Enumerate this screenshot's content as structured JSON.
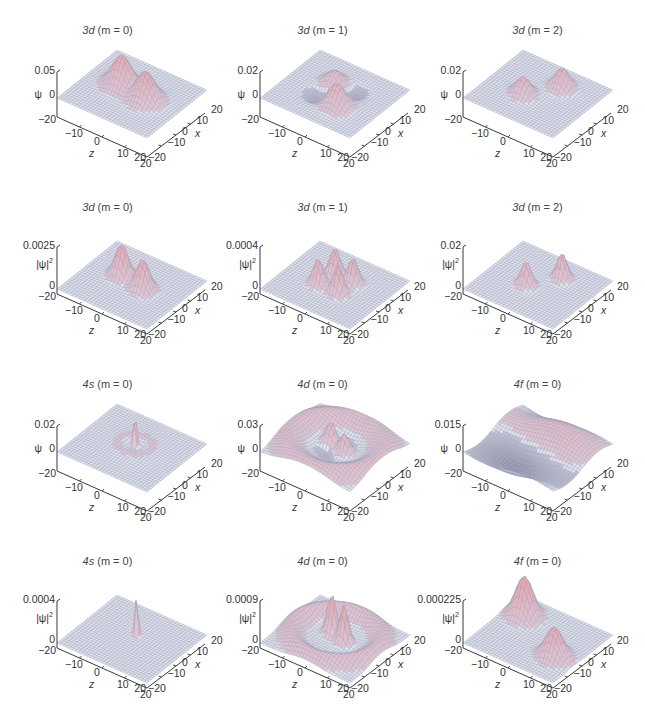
{
  "figure": {
    "rows": 4,
    "cols": 3
  },
  "chart_data": [
    {
      "type": "surface",
      "title": "3d (m = 0)",
      "orbital": "3d",
      "m": 0,
      "quantity": "psi",
      "zlabel": "ψ",
      "zticks": [
        "0.05",
        "0"
      ],
      "zmin_tick": "-20",
      "xlabel": "z",
      "ylabel": "x",
      "xticks": [
        "-10",
        "0",
        "10",
        "20"
      ],
      "yticks": [
        "-20",
        "-10",
        "0",
        "10",
        "20"
      ],
      "xlim": [
        -20,
        20
      ],
      "ylim": [
        -20,
        20
      ],
      "zmax": 0.05,
      "shape": "two lobes along z with opposite-sign ring"
    },
    {
      "type": "surface",
      "title": "3d (m = 1)",
      "orbital": "3d",
      "m": 1,
      "quantity": "psi",
      "zlabel": "ψ",
      "zticks": [
        "0.02",
        "0"
      ],
      "zmin_tick": "-20",
      "xlabel": "z",
      "ylabel": "x",
      "xticks": [
        "-10",
        "0",
        "10",
        "20"
      ],
      "yticks": [
        "-20",
        "-10",
        "0",
        "10",
        "20"
      ],
      "xlim": [
        -20,
        20
      ],
      "ylim": [
        -20,
        20
      ],
      "zmax": 0.02,
      "shape": "four-lobe saddle (positive/negative diagonals)"
    },
    {
      "type": "surface",
      "title": "3d (m = 2)",
      "orbital": "3d",
      "m": 2,
      "quantity": "psi",
      "zlabel": "ψ",
      "zticks": [
        "0.02",
        "0"
      ],
      "zmin_tick": "-20",
      "xlabel": "z",
      "ylabel": "x",
      "xticks": [
        "-10",
        "0",
        "10",
        "20"
      ],
      "yticks": [
        "-20",
        "-10",
        "0",
        "10",
        "20"
      ],
      "xlim": [
        -20,
        20
      ],
      "ylim": [
        -20,
        20
      ],
      "zmax": 0.02,
      "shape": "two lobes along x"
    },
    {
      "type": "surface",
      "title": "3d (m = 0)",
      "orbital": "3d",
      "m": 0,
      "quantity": "|psi|^2",
      "zlabel": "|ψ|²",
      "zticks": [
        "0.0025",
        "0"
      ],
      "zmin_tick": "-20",
      "xlabel": "z",
      "ylabel": "x",
      "xticks": [
        "-10",
        "0",
        "10",
        "20"
      ],
      "yticks": [
        "-20",
        "-10",
        "0",
        "10",
        "20"
      ],
      "xlim": [
        -20,
        20
      ],
      "ylim": [
        -20,
        20
      ],
      "zmax": 0.0025,
      "shape": "two peaks along z"
    },
    {
      "type": "surface",
      "title": "3d (m = 1)",
      "orbital": "3d",
      "m": 1,
      "quantity": "|psi|^2",
      "zlabel": "|ψ|²",
      "zticks": [
        "0.0004",
        "0"
      ],
      "zmin_tick": "-20",
      "xlabel": "z",
      "ylabel": "x",
      "xticks": [
        "-10",
        "0",
        "10",
        "20"
      ],
      "yticks": [
        "-20",
        "-10",
        "0",
        "10",
        "20"
      ],
      "xlim": [
        -20,
        20
      ],
      "ylim": [
        -20,
        20
      ],
      "zmax": 0.0004,
      "shape": "four peaks"
    },
    {
      "type": "surface",
      "title": "3d (m = 2)",
      "orbital": "3d",
      "m": 2,
      "quantity": "|psi|^2",
      "zlabel": "|ψ|²",
      "zticks": [
        "0.02",
        "0"
      ],
      "zmin_tick": "-20",
      "xlabel": "z",
      "ylabel": "x",
      "xticks": [
        "-10",
        "0",
        "10",
        "20"
      ],
      "yticks": [
        "-20",
        "-10",
        "0",
        "10",
        "20"
      ],
      "xlim": [
        -20,
        20
      ],
      "ylim": [
        -20,
        20
      ],
      "zmax": 0.02,
      "shape": "two peaks along x"
    },
    {
      "type": "surface",
      "title": "4s (m = 0)",
      "orbital": "4s",
      "m": 0,
      "quantity": "psi",
      "zlabel": "ψ",
      "zticks": [
        "0.02",
        "0"
      ],
      "zmin_tick": "-20",
      "xlabel": "z",
      "ylabel": "x",
      "xticks": [
        "-10",
        "0",
        "10",
        "20"
      ],
      "yticks": [
        "-20",
        "-10",
        "0",
        "10",
        "20"
      ],
      "xlim": [
        -20,
        20
      ],
      "ylim": [
        -20,
        20
      ],
      "zmax": 0.02,
      "shape": "sharp central spike with radial nodes"
    },
    {
      "type": "surface",
      "title": "4d (m = 0)",
      "orbital": "4d",
      "m": 0,
      "quantity": "psi",
      "zlabel": "ψ",
      "zticks": [
        "0.03",
        "0"
      ],
      "zmin_tick": "-20",
      "xlabel": "z",
      "ylabel": "x",
      "xticks": [
        "-10",
        "0",
        "10",
        "20"
      ],
      "yticks": [
        "-20",
        "-10",
        "0",
        "10",
        "20"
      ],
      "xlim": [
        -20,
        20
      ],
      "ylim": [
        -20,
        20
      ],
      "zmax": 0.03,
      "shape": "two central lobes plus outer ring"
    },
    {
      "type": "surface",
      "title": "4f (m = 0)",
      "orbital": "4f",
      "m": 0,
      "quantity": "psi",
      "zlabel": "ψ",
      "zticks": [
        "0.015",
        "0"
      ],
      "zmin_tick": "-20",
      "xlabel": "z",
      "ylabel": "x",
      "xticks": [
        "-10",
        "0",
        "10",
        "20"
      ],
      "yticks": [
        "-20",
        "-10",
        "0",
        "10",
        "20"
      ],
      "xlim": [
        -20,
        20
      ],
      "ylim": [
        -20,
        20
      ],
      "zmax": 0.015,
      "shape": "broad alternating-sign lobes"
    },
    {
      "type": "surface",
      "title": "4s (m = 0)",
      "orbital": "4s",
      "m": 0,
      "quantity": "|psi|^2",
      "zlabel": "|ψ|²",
      "zticks": [
        "0.0004",
        "0"
      ],
      "zmin_tick": "-20",
      "xlabel": "z",
      "ylabel": "x",
      "xticks": [
        "-10",
        "0",
        "10",
        "20"
      ],
      "yticks": [
        "-20",
        "-10",
        "0",
        "10",
        "20"
      ],
      "xlim": [
        -20,
        20
      ],
      "ylim": [
        -20,
        20
      ],
      "zmax": 0.0004,
      "shape": "single sharp central spike"
    },
    {
      "type": "surface",
      "title": "4d (m = 0)",
      "orbital": "4d",
      "m": 0,
      "quantity": "|psi|^2",
      "zlabel": "|ψ|²",
      "zticks": [
        "0.0009",
        "0"
      ],
      "zmin_tick": "-20",
      "xlabel": "z",
      "ylabel": "x",
      "xticks": [
        "-10",
        "0",
        "10",
        "20"
      ],
      "yticks": [
        "-20",
        "-10",
        "0",
        "10",
        "20"
      ],
      "xlim": [
        -20,
        20
      ],
      "ylim": [
        -20,
        20
      ],
      "zmax": 0.0009,
      "shape": "two tall central peaks plus outer lobes"
    },
    {
      "type": "surface",
      "title": "4f (m = 0)",
      "orbital": "4f",
      "m": 0,
      "quantity": "|psi|^2",
      "zlabel": "|ψ|²",
      "zticks": [
        "0.000225",
        "0"
      ],
      "zmin_tick": "-20",
      "xlabel": "z",
      "ylabel": "x",
      "xticks": [
        "-10",
        "0",
        "10",
        "20"
      ],
      "yticks": [
        "-20",
        "-10",
        "0",
        "10",
        "20"
      ],
      "xlim": [
        -20,
        20
      ],
      "ylim": [
        -20,
        20
      ],
      "zmax": 0.000225,
      "shape": "two broad outer peaks"
    }
  ],
  "panels": [
    {
      "name": "3d",
      "m": "(m = 0)",
      "m_italic": "m",
      "zlabel": "ψ",
      "ztop": "0.05",
      "zzero": "0",
      "zbot": "-20"
    },
    {
      "name": "3d",
      "m": "(m = 1)",
      "zlabel": "ψ",
      "ztop": "0.02",
      "zzero": "0",
      "zbot": "-20"
    },
    {
      "name": "3d",
      "m": "(m = 2)",
      "zlabel": "ψ",
      "ztop": "0.02",
      "zzero": "0",
      "zbot": "-20"
    },
    {
      "name": "3d",
      "m": "(m = 0)",
      "zlabel": "|ψ|",
      "zsup": "2",
      "ztop": "0.0025",
      "zzero": "0",
      "zbot": "-20"
    },
    {
      "name": "3d",
      "m": "(m = 1)",
      "zlabel": "|ψ|",
      "zsup": "2",
      "ztop": "0.0004",
      "zzero": "0",
      "zbot": "-20"
    },
    {
      "name": "3d",
      "m": "(m = 2)",
      "zlabel": "|ψ|",
      "zsup": "2",
      "ztop": "0.02",
      "zzero": "0",
      "zbot": "-20"
    },
    {
      "name": "4s",
      "m": "(m = 0)",
      "zlabel": "ψ",
      "ztop": "0.02",
      "zzero": "0",
      "zbot": "-20"
    },
    {
      "name": "4d",
      "m": "(m = 0)",
      "zlabel": "ψ",
      "ztop": "0.03",
      "zzero": "0",
      "zbot": "-20"
    },
    {
      "name": "4f",
      "m": "(m = 0)",
      "zlabel": "ψ",
      "ztop": "0.015",
      "zzero": "0",
      "zbot": "-20"
    },
    {
      "name": "4s",
      "m": "(m = 0)",
      "zlabel": "|ψ|",
      "zsup": "2",
      "ztop": "0.0004",
      "zzero": "0",
      "zbot": "-20"
    },
    {
      "name": "4d",
      "m": "(m = 0)",
      "zlabel": "|ψ|",
      "zsup": "2",
      "ztop": "0.0009",
      "zzero": "0",
      "zbot": "-20"
    },
    {
      "name": "4f",
      "m": "(m = 0)",
      "zlabel": "|ψ|",
      "zsup": "2",
      "ztop": "0.000225",
      "zzero": "0",
      "zbot": "-20"
    }
  ],
  "axes": {
    "front_label": "z",
    "side_label": "x",
    "front_ticks": [
      "-10",
      "0",
      "10",
      "20"
    ],
    "side_ticks": [
      "-20",
      "-10",
      "0",
      "10",
      "20"
    ]
  },
  "colors": {
    "surface_pos": "#e8b4ba",
    "surface_flat": "#d8dbe8",
    "mesh_line": "#8a90a8",
    "shadow": "#4a4258",
    "axis": "#222222"
  }
}
